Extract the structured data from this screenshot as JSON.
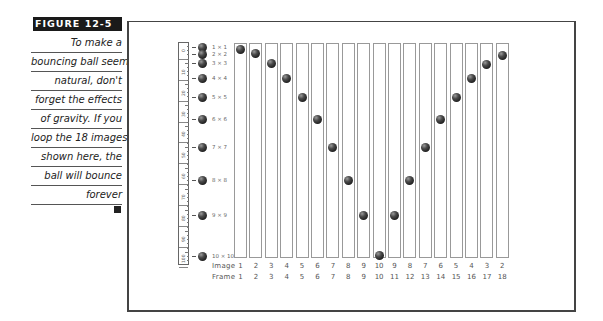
{
  "caption": {
    "figure_label": "FIGURE 12-5",
    "lines": [
      "To make a",
      "bouncing ball seem",
      "natural, don't",
      "forget the effects",
      "of gravity. If you",
      "loop the 18 images",
      "shown here, the",
      "ball will bounce",
      "forever"
    ]
  },
  "ruler": {
    "labels": [
      "0",
      "10",
      "20",
      "30",
      "40",
      "50",
      "60",
      "70",
      "80",
      "90",
      "100"
    ]
  },
  "reference_balls": [
    {
      "label": "1 × 1",
      "y": 47
    },
    {
      "label": "2 × 2",
      "y": 54
    },
    {
      "label": "3 × 3",
      "y": 63
    },
    {
      "label": "4 × 4",
      "y": 78
    },
    {
      "label": "5 × 5",
      "y": 97
    },
    {
      "label": "6 × 6",
      "y": 119
    },
    {
      "label": "7 × 7",
      "y": 147
    },
    {
      "label": "8 × 8",
      "y": 180
    },
    {
      "label": "9 × 9",
      "y": 215
    },
    {
      "label": "10 × 10",
      "y": 256
    }
  ],
  "sequence": {
    "image_row_label": "Image",
    "frame_row_label": "Frame",
    "frames": [
      {
        "image": "1",
        "frame": "1",
        "ball_y": 49
      },
      {
        "image": "2",
        "frame": "2",
        "ball_y": 53
      },
      {
        "image": "3",
        "frame": "3",
        "ball_y": 63
      },
      {
        "image": "4",
        "frame": "4",
        "ball_y": 78
      },
      {
        "image": "5",
        "frame": "5",
        "ball_y": 97
      },
      {
        "image": "6",
        "frame": "6",
        "ball_y": 119
      },
      {
        "image": "7",
        "frame": "7",
        "ball_y": 147
      },
      {
        "image": "8",
        "frame": "8",
        "ball_y": 180
      },
      {
        "image": "9",
        "frame": "9",
        "ball_y": 215
      },
      {
        "image": "10",
        "frame": "10",
        "ball_y": 255
      },
      {
        "image": "9",
        "frame": "11",
        "ball_y": 215
      },
      {
        "image": "8",
        "frame": "12",
        "ball_y": 180
      },
      {
        "image": "7",
        "frame": "13",
        "ball_y": 147
      },
      {
        "image": "6",
        "frame": "14",
        "ball_y": 119
      },
      {
        "image": "5",
        "frame": "15",
        "ball_y": 97
      },
      {
        "image": "4",
        "frame": "16",
        "ball_y": 78
      },
      {
        "image": "3",
        "frame": "17",
        "ball_y": 64
      },
      {
        "image": "2",
        "frame": "18",
        "ball_y": 55
      }
    ]
  }
}
